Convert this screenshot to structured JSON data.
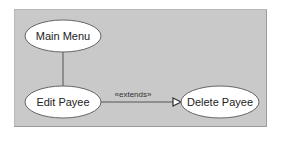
{
  "diagram": {
    "type": "uml-use-case",
    "background": "#c9c9c9",
    "nodes": [
      {
        "id": "main-menu",
        "label": "Main Menu",
        "cx": 63,
        "cy": 36,
        "rx": 38,
        "ry": 16
      },
      {
        "id": "edit-payee",
        "label": "Edit Payee",
        "cx": 63,
        "cy": 102,
        "rx": 38,
        "ry": 16
      },
      {
        "id": "delete-payee",
        "label": "Delete Payee",
        "cx": 220,
        "cy": 102,
        "rx": 39,
        "ry": 16
      }
    ],
    "edges": [
      {
        "from": "main-menu",
        "to": "edit-payee",
        "type": "association",
        "label": ""
      },
      {
        "from": "edit-payee",
        "to": "delete-payee",
        "type": "extends",
        "label": "«extends»"
      }
    ]
  }
}
